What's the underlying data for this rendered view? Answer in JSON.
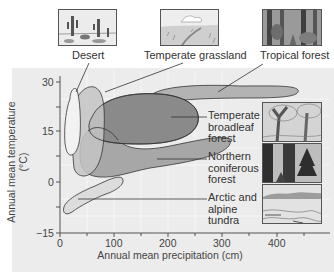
{
  "diagram": {
    "title_labels": {
      "desert": "Desert",
      "temperate_grassland": "Temperate grassland",
      "tropical_forest": "Tropical forest"
    },
    "side_labels": {
      "temperate_broadleaf": [
        "Temperate",
        "broadleaf",
        "forest"
      ],
      "northern_coniferous": [
        "Northern",
        "coniferous",
        "forest"
      ],
      "arctic_tundra": [
        "Arctic and",
        "alpine",
        "tundra"
      ]
    },
    "axes": {
      "x_label": "Annual mean precipitation (cm)",
      "y_label": "Annual mean temperature (°C)",
      "x_ticks": [
        "0",
        "100",
        "200",
        "300",
        "400"
      ],
      "y_ticks": [
        "30",
        "15",
        "0",
        "−15"
      ]
    },
    "pictures": [
      {
        "name": "desert-illustration",
        "caption": "Desert"
      },
      {
        "name": "grassland-illustration",
        "caption": "Temperate grassland"
      },
      {
        "name": "tropical-forest-illustration",
        "caption": "Tropical forest"
      },
      {
        "name": "broadleaf-forest-illustration",
        "caption": "Temperate broadleaf forest"
      },
      {
        "name": "coniferous-forest-illustration",
        "caption": "Northern coniferous forest"
      },
      {
        "name": "tundra-illustration",
        "caption": "Arctic and alpine tundra"
      }
    ],
    "colors": {
      "panel_bg": "#ececec",
      "desert_fill": "#f2f2f2",
      "grassland_fill": "#c4c4c4",
      "tropical_fill": "#b3b3b3",
      "broadleaf_fill": "#8a8a8a",
      "coniferous_fill": "#a7a7a7",
      "tundra_fill": "#dcdcdc",
      "stroke": "#333333"
    }
  }
}
